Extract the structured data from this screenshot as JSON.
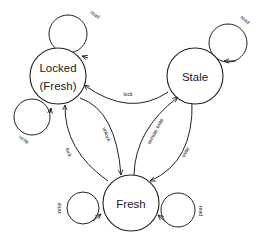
{
  "diagram": {
    "type": "state-machine",
    "nodes": {
      "locked": {
        "line1": "Locked",
        "line2": "(Fresh)"
      },
      "stale": {
        "label": "Stale"
      },
      "fresh": {
        "label": "Fresh"
      }
    },
    "edges": {
      "locked_read": "read",
      "locked_write": "write",
      "stale_read": "read",
      "stale_to_locked": "lock",
      "locked_to_fresh": "unlock",
      "fresh_to_locked": "lock",
      "fresh_to_stale": "remote write",
      "stale_to_fresh": "write",
      "fresh_write": "write",
      "fresh_read": "read"
    }
  }
}
